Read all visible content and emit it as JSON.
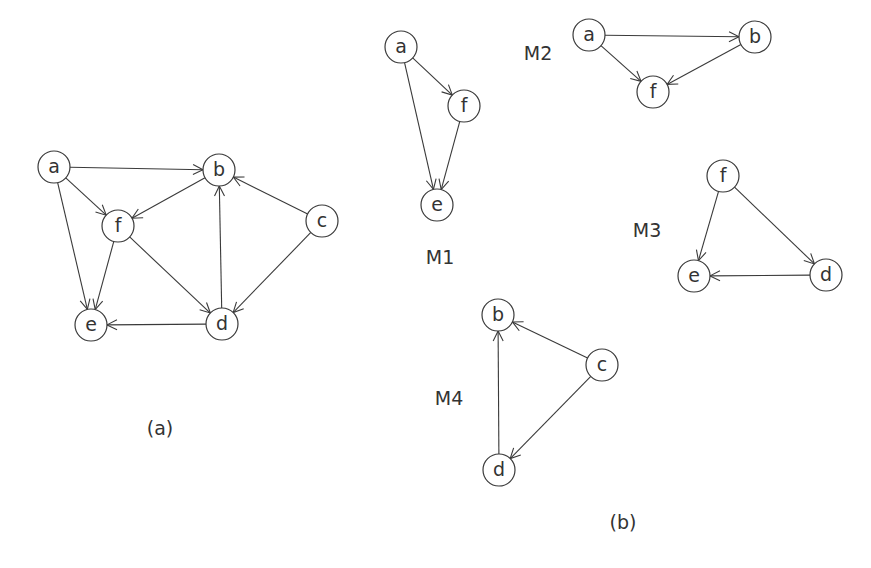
{
  "figure": {
    "node_radius": 16,
    "stroke_color": "#3a3a3a",
    "text_color": "#333333",
    "background": "#ffffff"
  },
  "graphs": [
    {
      "id": "main",
      "caption": "(a)",
      "caption_pos": [
        160,
        428
      ],
      "nodes": [
        {
          "id": "a",
          "label": "a",
          "x": 54,
          "y": 167
        },
        {
          "id": "b",
          "label": "b",
          "x": 219,
          "y": 170
        },
        {
          "id": "c",
          "label": "c",
          "x": 322,
          "y": 221
        },
        {
          "id": "f",
          "label": "f",
          "x": 118,
          "y": 226
        },
        {
          "id": "e",
          "label": "e",
          "x": 91,
          "y": 325
        },
        {
          "id": "d",
          "label": "d",
          "x": 222,
          "y": 324
        }
      ],
      "edges": [
        {
          "from": "a",
          "to": "b"
        },
        {
          "from": "a",
          "to": "f"
        },
        {
          "from": "a",
          "to": "e"
        },
        {
          "from": "b",
          "to": "f"
        },
        {
          "from": "f",
          "to": "e"
        },
        {
          "from": "f",
          "to": "d"
        },
        {
          "from": "c",
          "to": "b"
        },
        {
          "from": "c",
          "to": "d"
        },
        {
          "from": "d",
          "to": "b"
        },
        {
          "from": "d",
          "to": "e"
        }
      ]
    },
    {
      "id": "M1",
      "caption": "M1",
      "caption_pos": [
        440,
        257
      ],
      "nodes": [
        {
          "id": "a",
          "label": "a",
          "x": 401,
          "y": 47
        },
        {
          "id": "f",
          "label": "f",
          "x": 464,
          "y": 106
        },
        {
          "id": "e",
          "label": "e",
          "x": 437,
          "y": 205
        }
      ],
      "edges": [
        {
          "from": "a",
          "to": "f"
        },
        {
          "from": "a",
          "to": "e"
        },
        {
          "from": "f",
          "to": "e"
        }
      ]
    },
    {
      "id": "M2",
      "caption": "M2",
      "caption_pos": [
        538,
        53
      ],
      "nodes": [
        {
          "id": "a",
          "label": "a",
          "x": 589,
          "y": 35
        },
        {
          "id": "b",
          "label": "b",
          "x": 755,
          "y": 37
        },
        {
          "id": "f",
          "label": "f",
          "x": 653,
          "y": 92
        }
      ],
      "edges": [
        {
          "from": "a",
          "to": "b"
        },
        {
          "from": "a",
          "to": "f"
        },
        {
          "from": "b",
          "to": "f"
        }
      ]
    },
    {
      "id": "M3",
      "caption": "M3",
      "caption_pos": [
        647,
        230
      ],
      "nodes": [
        {
          "id": "f",
          "label": "f",
          "x": 723,
          "y": 176
        },
        {
          "id": "e",
          "label": "e",
          "x": 694,
          "y": 276
        },
        {
          "id": "d",
          "label": "d",
          "x": 826,
          "y": 275
        }
      ],
      "edges": [
        {
          "from": "f",
          "to": "e"
        },
        {
          "from": "f",
          "to": "d"
        },
        {
          "from": "d",
          "to": "e"
        }
      ]
    },
    {
      "id": "M4",
      "caption": "M4",
      "caption_pos": [
        449,
        398
      ],
      "nodes": [
        {
          "id": "b",
          "label": "b",
          "x": 498,
          "y": 315
        },
        {
          "id": "c",
          "label": "c",
          "x": 602,
          "y": 365
        },
        {
          "id": "d",
          "label": "d",
          "x": 499,
          "y": 470
        }
      ],
      "edges": [
        {
          "from": "c",
          "to": "b"
        },
        {
          "from": "c",
          "to": "d"
        },
        {
          "from": "d",
          "to": "b"
        }
      ]
    }
  ],
  "panel_captions": {
    "a": "(a)",
    "b": "(b)"
  },
  "panel_caption_pos": {
    "b": [
      623,
      522
    ]
  }
}
